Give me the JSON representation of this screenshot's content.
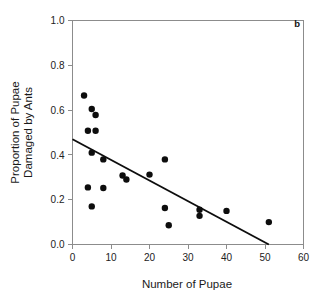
{
  "panel": {
    "label": "b"
  },
  "chart_data": {
    "type": "scatter",
    "title": "",
    "subtitle": "",
    "xlabel": "Number of Pupae",
    "ylabel": "Proportion of Pupae Damaged by Ants",
    "ylabel_lines": [
      "Proportion of Pupae",
      "Damaged by Ants"
    ],
    "xlim": [
      0,
      60
    ],
    "ylim": [
      0.0,
      1.0
    ],
    "xticks": [
      0,
      10,
      20,
      30,
      40,
      50,
      60
    ],
    "xtick_labels": [
      "0",
      "10",
      "20",
      "30",
      "40",
      "50",
      "60"
    ],
    "yticks": [
      0.0,
      0.2,
      0.4,
      0.6,
      0.8,
      1.0
    ],
    "ytick_labels": [
      "0.0",
      "0.2",
      "0.4",
      "0.6",
      "0.8",
      "1.0"
    ],
    "grid": false,
    "legend": false,
    "legend_position": "none",
    "marker": "filled-circle",
    "marker_color": "#0d0d0d",
    "marker_size_px": 4.2,
    "points": [
      {
        "x": 3,
        "y": 0.665
      },
      {
        "x": 5,
        "y": 0.605
      },
      {
        "x": 6,
        "y": 0.578
      },
      {
        "x": 4,
        "y": 0.508
      },
      {
        "x": 6,
        "y": 0.508
      },
      {
        "x": 5,
        "y": 0.41
      },
      {
        "x": 8,
        "y": 0.38
      },
      {
        "x": 13,
        "y": 0.308
      },
      {
        "x": 14,
        "y": 0.29
      },
      {
        "x": 20,
        "y": 0.312
      },
      {
        "x": 24,
        "y": 0.38
      },
      {
        "x": 4,
        "y": 0.255
      },
      {
        "x": 8,
        "y": 0.252
      },
      {
        "x": 5,
        "y": 0.17
      },
      {
        "x": 24,
        "y": 0.163
      },
      {
        "x": 25,
        "y": 0.086
      },
      {
        "x": 33,
        "y": 0.155
      },
      {
        "x": 33,
        "y": 0.128
      },
      {
        "x": 40,
        "y": 0.15
      },
      {
        "x": 51,
        "y": 0.1
      }
    ],
    "fit_line": {
      "name": "regression-line",
      "color": "#0d0d0d",
      "x_start": 0,
      "y_start": 0.47,
      "x_end": 51,
      "y_end": 0.0
    }
  }
}
